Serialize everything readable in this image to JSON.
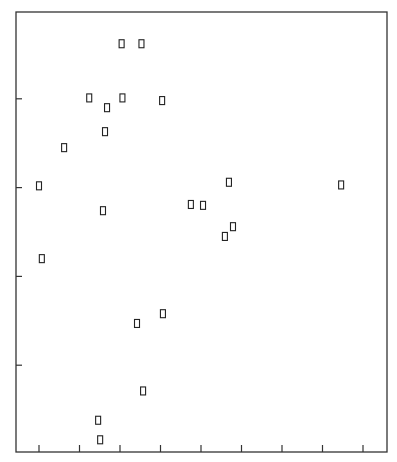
{
  "chart_data": {
    "type": "scatter",
    "title": "",
    "xlabel": "",
    "ylabel": "",
    "marker": "open-rectangle",
    "grid": false,
    "legend": null,
    "x_ticks": [
      1,
      2,
      3,
      4,
      5,
      6,
      7,
      8,
      9
    ],
    "y_ticks": [
      1,
      2,
      3,
      4
    ],
    "tick_labels_visible": false,
    "xlim": [
      0.43,
      10.0
    ],
    "ylim": [
      0.0,
      4.98
    ],
    "points": [
      {
        "x": 3.04,
        "y": 4.62
      },
      {
        "x": 3.53,
        "y": 4.62
      },
      {
        "x": 2.24,
        "y": 4.01
      },
      {
        "x": 3.06,
        "y": 4.01
      },
      {
        "x": 4.04,
        "y": 3.98
      },
      {
        "x": 2.68,
        "y": 3.9
      },
      {
        "x": 2.63,
        "y": 3.63
      },
      {
        "x": 1.62,
        "y": 3.45
      },
      {
        "x": 1.0,
        "y": 3.02
      },
      {
        "x": 5.69,
        "y": 3.06
      },
      {
        "x": 8.46,
        "y": 3.03
      },
      {
        "x": 4.75,
        "y": 2.81
      },
      {
        "x": 5.05,
        "y": 2.8
      },
      {
        "x": 2.58,
        "y": 2.74
      },
      {
        "x": 5.79,
        "y": 2.56
      },
      {
        "x": 5.59,
        "y": 2.45
      },
      {
        "x": 1.07,
        "y": 2.2
      },
      {
        "x": 4.06,
        "y": 1.58
      },
      {
        "x": 3.42,
        "y": 1.47
      },
      {
        "x": 3.57,
        "y": 0.71
      },
      {
        "x": 2.46,
        "y": 0.38
      },
      {
        "x": 2.51,
        "y": 0.16
      }
    ]
  },
  "plot_box": {
    "left": 16,
    "top": 12,
    "right": 387,
    "bottom": 452
  },
  "axis_map": {
    "x_px_at_1": 39,
    "x_px_per_unit": 40.5,
    "y_px_at_0": 454,
    "y_px_per_unit": 88.8
  },
  "colors": {
    "frame": "#333333",
    "marker": "#222222",
    "background": "#ffffff"
  }
}
